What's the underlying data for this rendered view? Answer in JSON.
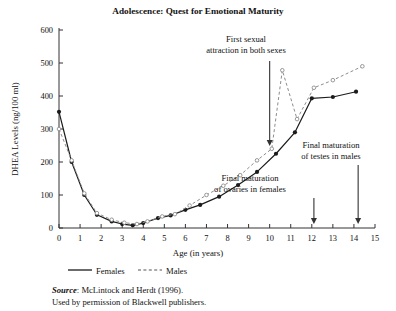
{
  "chart_data": {
    "type": "line",
    "title": "Adolescence: Quest for Emotional Maturity",
    "xlabel": "Age (in years)",
    "ylabel": "DHEA Levels (ng/100 ml)",
    "xlim": [
      0,
      15
    ],
    "ylim": [
      0,
      600
    ],
    "xticks": [
      "0",
      "1",
      "2",
      "3",
      "4",
      "5",
      "6",
      "7",
      "8",
      "9",
      "10",
      "11",
      "12",
      "13",
      "14",
      "15"
    ],
    "yticks": [
      "0",
      "100",
      "200",
      "300",
      "400",
      "500",
      "600"
    ],
    "grid": false,
    "legend_position": "below-axes",
    "series": [
      {
        "name": "Females",
        "style": "solid",
        "marker": "filled-circle",
        "color": "#1b1b1b",
        "points": [
          [
            0.0,
            352
          ],
          [
            0.6,
            200
          ],
          [
            1.2,
            100
          ],
          [
            1.8,
            40
          ],
          [
            2.5,
            20
          ],
          [
            3.0,
            12
          ],
          [
            3.5,
            8
          ],
          [
            4.0,
            15
          ],
          [
            4.7,
            30
          ],
          [
            5.3,
            38
          ],
          [
            6.0,
            55
          ],
          [
            6.7,
            70
          ],
          [
            7.6,
            95
          ],
          [
            8.5,
            130
          ],
          [
            9.4,
            170
          ],
          [
            10.3,
            225
          ],
          [
            11.2,
            290
          ],
          [
            12.0,
            393
          ],
          [
            13.0,
            397
          ],
          [
            14.1,
            413
          ]
        ]
      },
      {
        "name": "Males",
        "style": "dashed",
        "marker": "open-circle",
        "color": "#8c8c8c",
        "points": [
          [
            0.0,
            300
          ],
          [
            0.6,
            205
          ],
          [
            1.2,
            105
          ],
          [
            1.8,
            45
          ],
          [
            2.5,
            25
          ],
          [
            3.1,
            16
          ],
          [
            3.7,
            12
          ],
          [
            4.2,
            20
          ],
          [
            4.9,
            35
          ],
          [
            5.5,
            42
          ],
          [
            6.2,
            68
          ],
          [
            7.0,
            100
          ],
          [
            7.8,
            128
          ],
          [
            8.6,
            160
          ],
          [
            9.4,
            205
          ],
          [
            10.1,
            240
          ],
          [
            10.6,
            478
          ],
          [
            11.3,
            330
          ],
          [
            12.1,
            425
          ],
          [
            13.0,
            448
          ],
          [
            14.4,
            490
          ]
        ]
      }
    ],
    "annotations": [
      {
        "text_lines": [
          "First sexual",
          "attraction in both sexes"
        ],
        "arrow_x": 10.0
      },
      {
        "text_lines": [
          "Final maturation",
          "of ovaries in females"
        ],
        "arrow_x": 12.1
      },
      {
        "text_lines": [
          "Final maturation",
          "of testes in males"
        ],
        "arrow_x": 14.2
      }
    ],
    "source_label": "Source",
    "source_text": ": McLintock and Herdt (1996).",
    "permission_text": "Used by permission of Blackwell publishers."
  }
}
